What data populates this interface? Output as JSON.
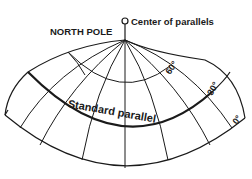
{
  "diagram": {
    "type": "conic projection graticule",
    "labels": {
      "north_pole": "NORTH POLE",
      "center_of_parallels": "Center of parallels",
      "standard_parallel": "Standard parallel",
      "lat_60": "60°",
      "lat_30": "30°",
      "lat_0": "0°"
    },
    "colors": {
      "ink": "#1a1a1a",
      "background": "#ffffff"
    }
  }
}
